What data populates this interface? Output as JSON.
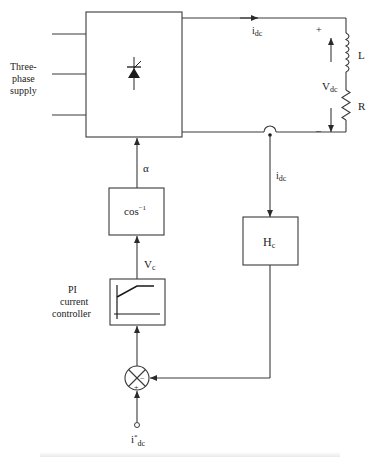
{
  "diagram": {
    "colors": {
      "line": "#3a3a3a",
      "text": "#222222",
      "background": "#ffffff"
    },
    "source": {
      "label_line1": "Three-",
      "label_line2": "phase",
      "label_line3": "supply"
    },
    "converter": {
      "symbol": "thyristor-icon"
    },
    "dc_side": {
      "current_label": "i",
      "current_sub": "dc",
      "voltage_label": "V",
      "voltage_sub": "dc",
      "plus": "+",
      "minus": "–",
      "inductor_label": "L",
      "resistor_label": "R"
    },
    "firing_angle_label": "α",
    "arccos_block": {
      "label": "cos",
      "sup": "−1"
    },
    "control_voltage": {
      "label": "V",
      "sub": "c"
    },
    "pi_controller": {
      "label_line1": "PI",
      "label_line2": "current",
      "label_line3": "controller"
    },
    "feedback": {
      "current_label": "i",
      "current_sub": "dc"
    },
    "sensor_block": {
      "label": "H",
      "sub": "c"
    },
    "summing_junction": {
      "plus": "+",
      "minus": "−"
    },
    "reference": {
      "label": "i",
      "sup": "*",
      "sub": "dc"
    }
  }
}
